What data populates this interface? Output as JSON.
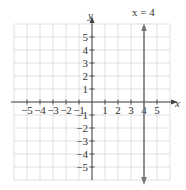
{
  "chart_data": {
    "type": "line",
    "title": "",
    "xlabel": "x",
    "ylabel": "y",
    "xlim": [
      -6,
      6
    ],
    "ylim": [
      -6,
      6
    ],
    "grid": true,
    "x_ticks": [
      -5,
      -4,
      -3,
      -2,
      -1,
      1,
      2,
      3,
      4,
      5
    ],
    "y_ticks": [
      5,
      4,
      3,
      2,
      1,
      -1,
      -2,
      -3,
      -4,
      -5
    ],
    "x_tick_labels": [
      "−5",
      "−4",
      "−3",
      "−2",
      "−1",
      "1",
      "2",
      "3",
      "4",
      "5"
    ],
    "y_tick_labels": [
      "5",
      "4",
      "3",
      "2",
      "1",
      "−1",
      "−2",
      "−3",
      "−4",
      "−5"
    ],
    "series": [
      {
        "name": "x = 4",
        "type": "vertical-line",
        "x": [
          4,
          4
        ],
        "y": [
          -6,
          6
        ],
        "arrows": "both",
        "color": "#777777"
      }
    ],
    "annotations": [
      {
        "text": "x = 4",
        "x": 4,
        "y": 6.5
      }
    ]
  },
  "labels": {
    "x_axis": "x",
    "y_axis": "y",
    "line_equation": "x = 4"
  }
}
